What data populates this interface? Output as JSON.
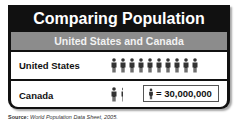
{
  "chart_data": {
    "type": "pictograph",
    "title": "Comparing Population",
    "subtitle": "United States and Canada",
    "unit_label": "= 30,000,000",
    "unit_value": 30000000,
    "categories": [
      "United States",
      "Canada"
    ],
    "icon_counts": [
      10,
      1.1
    ],
    "values": [
      300000000,
      33000000
    ],
    "source_label": "Source:",
    "source_text": "World Population Data Sheet, 2005."
  },
  "colors": {
    "frame": "#111111",
    "subtitle_bar": "#8c8c8c",
    "icon": "#333333"
  }
}
